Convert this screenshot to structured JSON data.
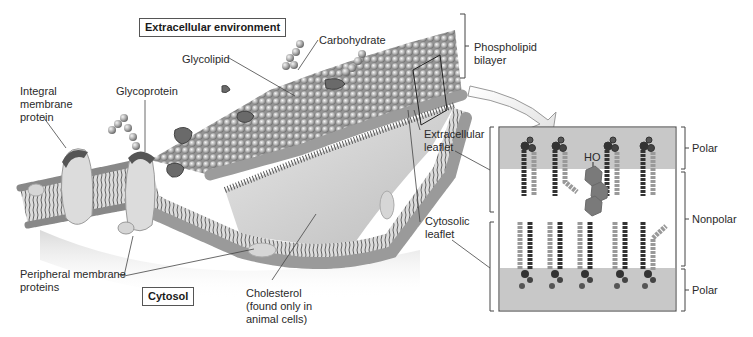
{
  "diagram": {
    "title_boxes": {
      "extracellular": "Extracellular environment",
      "cytosol": "Cytosol"
    },
    "labels": {
      "carbohydrate": "Carbohydrate",
      "glycolipid": "Glycolipid",
      "glycoprotein": "Glycoprotein",
      "integral_protein": "Integral\nmembrane\nprotein",
      "peripheral_proteins": "Peripheral membrane\nproteins",
      "cholesterol": "Cholesterol\n(found only in\nanimal cells)",
      "phospholipid_bilayer": "Phospholipid\nbilayer",
      "extracellular_leaflet": "Extracellular\nleaflet",
      "cytosolic_leaflet": "Cytosolic\nleaflet"
    },
    "inset": {
      "hydroxyl_label": "HO",
      "regions": [
        {
          "name": "polar-top",
          "label": "Polar"
        },
        {
          "name": "nonpolar",
          "label": "Nonpolar"
        },
        {
          "name": "polar-bottom",
          "label": "Polar"
        }
      ]
    },
    "colors": {
      "polar_band": "#c8c8c8",
      "cholesterol": "#7a7a7a",
      "protein": "#d8d8d8",
      "head_group": "#a9a9a9"
    }
  }
}
